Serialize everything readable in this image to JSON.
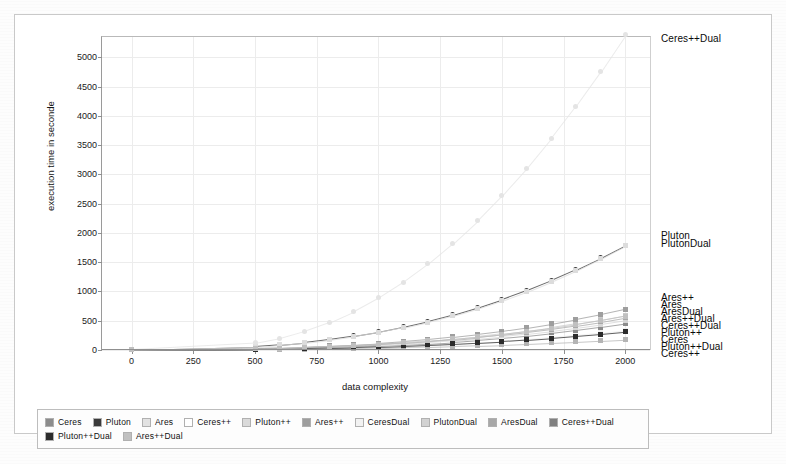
{
  "chart_data": {
    "type": "scatter",
    "title": "",
    "xlabel": "data complexity",
    "ylabel": "execution time in seconde",
    "xlim": [
      -120,
      2100
    ],
    "ylim": [
      0,
      5350
    ],
    "xticks": [
      0,
      250,
      500,
      750,
      1000,
      1250,
      1500,
      1750,
      2000
    ],
    "yticks": [
      0,
      500,
      1000,
      1500,
      2000,
      2500,
      3000,
      3500,
      4000,
      4500,
      5000
    ],
    "grid": true,
    "legend_position": "below-axes",
    "x": [
      0,
      500,
      600,
      700,
      800,
      900,
      1000,
      1100,
      1200,
      1300,
      1400,
      1500,
      1600,
      1700,
      1800,
      1900,
      2000
    ],
    "series": [
      {
        "name": "Ceres",
        "color": "#8c8c8c",
        "marker": "square",
        "values": [
          5,
          18,
          24,
          32,
          42,
          55,
          70,
          88,
          110,
          135,
          165,
          200,
          240,
          285,
          335,
          390,
          450
        ]
      },
      {
        "name": "Pluton",
        "color": "#3a3a3a",
        "marker": "circle",
        "values": [
          8,
          60,
          90,
          130,
          180,
          240,
          310,
          395,
          490,
          600,
          725,
          865,
          1020,
          1190,
          1375,
          1575,
          1790
        ]
      },
      {
        "name": "Ares",
        "color": "#d6d6d6",
        "marker": "square",
        "values": [
          4,
          22,
          30,
          40,
          52,
          68,
          86,
          108,
          133,
          162,
          196,
          234,
          277,
          325,
          378,
          437,
          500
        ]
      },
      {
        "name": "Ceres++",
        "color": "#b4b4b4",
        "marker": "square",
        "values": [
          3,
          10,
          13,
          17,
          22,
          28,
          35,
          43,
          52,
          63,
          75,
          88,
          103,
          120,
          138,
          158,
          180
        ]
      },
      {
        "name": "Pluton++",
        "color": "#cacaca",
        "marker": "square",
        "values": [
          6,
          26,
          36,
          48,
          63,
          82,
          104,
          130,
          160,
          195,
          235,
          280,
          330,
          386,
          448,
          517,
          592
        ]
      },
      {
        "name": "Ares++",
        "color": "#9e9e9e",
        "marker": "square",
        "values": [
          5,
          28,
          38,
          52,
          70,
          92,
          118,
          148,
          183,
          224,
          271,
          324,
          384,
          451,
          526,
          609,
          700
        ]
      },
      {
        "name": "CeresDual",
        "color": "#efefef",
        "marker": "square",
        "values": [
          4,
          14,
          19,
          26,
          34,
          44,
          56,
          70,
          87,
          106,
          128,
          154,
          183,
          216,
          253,
          294,
          340
        ]
      },
      {
        "name": "PlutonDual",
        "color": "#dcdcdc",
        "marker": "square",
        "values": [
          7,
          58,
          88,
          126,
          174,
          232,
          300,
          382,
          476,
          583,
          705,
          843,
          997,
          1168,
          1356,
          1562,
          1785
        ]
      },
      {
        "name": "AresDual",
        "color": "#a8a8a8",
        "marker": "square",
        "values": [
          4,
          24,
          33,
          44,
          58,
          75,
          95,
          119,
          147,
          179,
          216,
          258,
          305,
          358,
          417,
          482,
          554
        ]
      },
      {
        "name": "Ceres++Dual",
        "color": "#e4e4e4",
        "marker": "circle",
        "values": [
          10,
          120,
          200,
          320,
          470,
          660,
          890,
          1160,
          1470,
          1820,
          2210,
          2640,
          3110,
          3620,
          4170,
          4760,
          5390
        ]
      },
      {
        "name": "Pluton++Dual",
        "color": "#2b2b2b",
        "marker": "square",
        "values": [
          6,
          16,
          21,
          28,
          36,
          46,
          58,
          72,
          88,
          106,
          127,
          150,
          176,
          205,
          237,
          272,
          310
        ]
      },
      {
        "name": "Ares++Dual",
        "color": "#c0c0c0",
        "marker": "square",
        "values": [
          5,
          25,
          34,
          46,
          61,
          79,
          101,
          126,
          155,
          189,
          228,
          272,
          321,
          376,
          437,
          505,
          580
        ]
      }
    ],
    "annotations": [
      {
        "text": "Ceres++Dual",
        "x": 2000,
        "y": 5300
      },
      {
        "text": "Pluton",
        "x": 2000,
        "y": 1930
      },
      {
        "text": "PlutonDual",
        "x": 2000,
        "y": 1790
      },
      {
        "text": "Ares++",
        "x": 2000,
        "y": 880
      },
      {
        "text": "Ares",
        "x": 2000,
        "y": 760
      },
      {
        "text": "AresDual",
        "x": 2000,
        "y": 640
      },
      {
        "text": "Ares++Dual",
        "x": 2000,
        "y": 520
      },
      {
        "text": "Ceres++Dual",
        "x": 2000,
        "y": 400
      },
      {
        "text": "Pluton++",
        "x": 2000,
        "y": 280
      },
      {
        "text": "Ceres",
        "x": 2000,
        "y": 160
      },
      {
        "text": "Pluton++Dual",
        "x": 2000,
        "y": 40
      },
      {
        "text": "Ceres++",
        "x": 2000,
        "y": -80
      }
    ]
  },
  "legend": {
    "row1": [
      {
        "label": "Ceres",
        "color": "#8c8c8c"
      },
      {
        "label": "Pluton",
        "color": "#3a3a3a"
      },
      {
        "label": "Ares",
        "color": "#e2e2e2"
      },
      {
        "label": "Ceres++",
        "color": "#ffffff"
      },
      {
        "label": "Pluton++",
        "color": "#dadada"
      },
      {
        "label": "Ares++",
        "color": "#9e9e9e"
      },
      {
        "label": "CeresDual",
        "color": "#f2f2f2"
      },
      {
        "label": "PlutonDual",
        "color": "#d2d2d2"
      },
      {
        "label": "AresDual",
        "color": "#a8a8a8"
      },
      {
        "label": "Ceres++Dual",
        "color": "#808080"
      }
    ],
    "row2": [
      {
        "label": "Pluton++Dual",
        "color": "#2b2b2b"
      },
      {
        "label": "Ares++Dual",
        "color": "#c0c0c0"
      }
    ]
  }
}
